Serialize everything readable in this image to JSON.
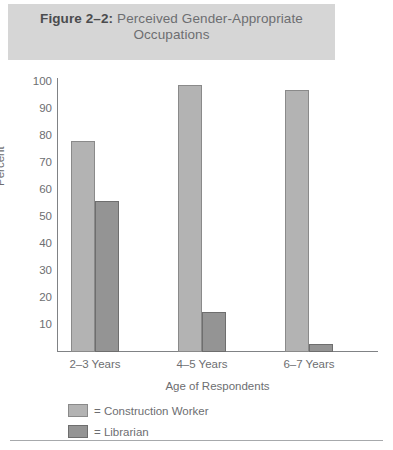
{
  "title": {
    "figure_label": "Figure 2–2:",
    "text": "Perceived Gender-Appropriate Occupations",
    "band_color": "#d6d6d6"
  },
  "legend": {
    "position": "below-axis",
    "entries": [
      {
        "prefix": "=",
        "label": "Construction Worker",
        "color": "#b3b3b3"
      },
      {
        "prefix": "=",
        "label": "Librarian",
        "color": "#949494"
      }
    ]
  },
  "chart_data": {
    "type": "bar",
    "title": "Figure 2–2: Perceived Gender-Appropriate Occupations",
    "xlabel": "Age of Respondents",
    "ylabel": "Percent",
    "categories": [
      "2–3 Years",
      "4–5 Years",
      "6–7 Years"
    ],
    "series": [
      {
        "name": "Construction Worker",
        "color": "#b3b3b3",
        "values": [
          78,
          99,
          97
        ]
      },
      {
        "name": "Librarian",
        "color": "#949494",
        "values": [
          56,
          15,
          3
        ]
      }
    ],
    "ylim": [
      0,
      100
    ],
    "yticks": [
      10,
      20,
      30,
      40,
      50,
      60,
      70,
      80,
      90,
      100
    ],
    "ytick_labels": [
      "10",
      "20",
      "30",
      "40",
      "50",
      "60",
      "70",
      "80",
      "90",
      "100"
    ],
    "grid": false,
    "legend_position": "below"
  }
}
